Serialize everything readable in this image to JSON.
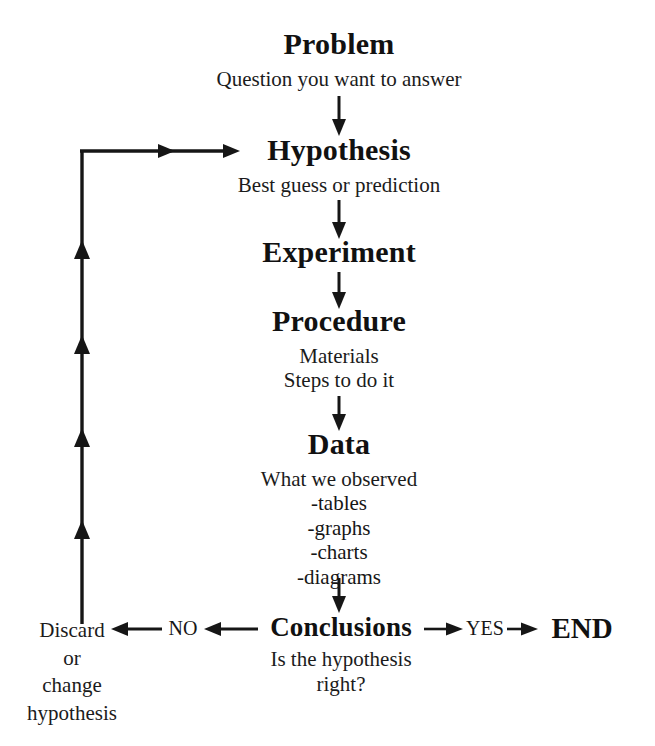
{
  "diagram": {
    "background_color": "#ffffff",
    "ink_color": "#161616"
  },
  "stages": {
    "problem": {
      "title": "Problem",
      "subtitle": "Question you want to answer"
    },
    "hypothesis": {
      "title": "Hypothesis",
      "subtitle": "Best guess or prediction"
    },
    "experiment": {
      "title": "Experiment"
    },
    "procedure": {
      "title": "Procedure",
      "sub_line_1": "Materials",
      "sub_line_2": "Steps to do it"
    },
    "data": {
      "title": "Data",
      "subtitle": "What we observed",
      "items": [
        "-tables",
        "-graphs",
        "-charts",
        "-diagrams"
      ]
    },
    "conclusions": {
      "title": "Conclusions",
      "sub_line_1": "Is the hypothesis",
      "sub_line_2": "right?"
    }
  },
  "branches": {
    "no_label": "NO",
    "yes_label": "YES",
    "end_label": "END",
    "discard": {
      "line_1": "Discard",
      "line_2": "or",
      "line_3": "change",
      "line_4": "hypothesis"
    }
  },
  "connectors": {
    "problem_to_hypothesis": "down-arrow",
    "hypothesis_to_experiment": "down-arrow",
    "experiment_to_procedure": "down-arrow",
    "procedure_to_data": "down-arrow",
    "data_to_conclusions": "down-arrow",
    "conclusions_to_no": "left-arrow",
    "no_to_discard": "left-arrow",
    "conclusions_to_yes": "right-arrow",
    "yes_to_end": "right-arrow",
    "feedback_loop": "up-left-then-right-arrow"
  }
}
